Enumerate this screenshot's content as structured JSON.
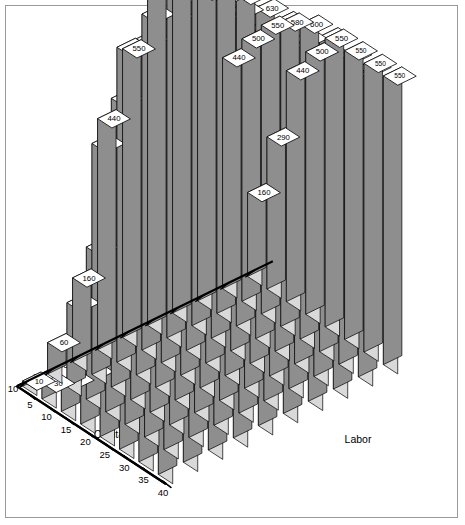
{
  "chart_data": {
    "type": "bar",
    "projection": "3d-isometric",
    "title": "",
    "xlabel": "Labor",
    "ylabel": "Capital",
    "zlabel": "",
    "grid": false,
    "legend": null,
    "x_categories": [
      10,
      20,
      30,
      40,
      50,
      60,
      70,
      80,
      90,
      100
    ],
    "y_categories": [
      40,
      35,
      30,
      25,
      20,
      15,
      10,
      5
    ],
    "x_tick_labels": [
      "10",
      "20",
      "30",
      "40",
      "50",
      "60",
      "70",
      "80",
      "90",
      "100"
    ],
    "y_tick_labels": [
      "40",
      "35",
      "30",
      "25",
      "20",
      "15",
      "10",
      "5"
    ],
    "zlim": [
      0,
      700
    ],
    "series": [
      {
        "name": "Capital 40",
        "capital": 40,
        "values": [
          130,
          440,
          500,
          550,
          600,
          620,
          600,
          600,
          590,
          550
        ]
      },
      {
        "name": "Capital 35",
        "capital": 35,
        "values": [
          160,
          440,
          550,
          600,
          620,
          630,
          620,
          620,
          590,
          550
        ]
      },
      {
        "name": "Capital 30",
        "capital": 30,
        "values": [
          160,
          320,
          550,
          610,
          630,
          640,
          630,
          620,
          600,
          550
        ]
      },
      {
        "name": "Capital 25",
        "capital": 25,
        "values": [
          160,
          290,
          550,
          620,
          640,
          650,
          640,
          630,
          600,
          550
        ]
      },
      {
        "name": "Capital 20",
        "capital": 20,
        "values": [
          100,
          240,
          580,
          630,
          650,
          660,
          650,
          630,
          580,
          500
        ]
      },
      {
        "name": "Capital 15",
        "capital": 15,
        "values": [
          60,
          290,
          550,
          640,
          660,
          670,
          650,
          630,
          550,
          440
        ]
      },
      {
        "name": "Capital 10",
        "capital": 10,
        "values": [
          30,
          160,
          440,
          600,
          640,
          660,
          640,
          620,
          500,
          290
        ]
      },
      {
        "name": "Capital 5",
        "capital": 5,
        "values": [
          10,
          60,
          160,
          440,
          550,
          650,
          620,
          590,
          440,
          160
        ]
      }
    ],
    "visible_labels": [
      130,
      160,
      160,
      160,
      100,
      60,
      30,
      10,
      440,
      440,
      320,
      290,
      240,
      290,
      160,
      60,
      500,
      550,
      550,
      550,
      580,
      550,
      440,
      160,
      600,
      600,
      610,
      620,
      630,
      640,
      600,
      440,
      620,
      620,
      630,
      640,
      650,
      660,
      640,
      550,
      600,
      620,
      630,
      650,
      660,
      670,
      660,
      650,
      600,
      620,
      630,
      640,
      650,
      650,
      640,
      620,
      590,
      590,
      600,
      630,
      630,
      630,
      620,
      590,
      550,
      550,
      550,
      580,
      500,
      440,
      290,
      160,
      20,
      40,
      60,
      430,
      290,
      530,
      560
    ]
  },
  "axes": {
    "capital": {
      "title": "Capital",
      "ticks": [
        "40",
        "35",
        "30",
        "25",
        "20",
        "15",
        "10",
        "5"
      ]
    },
    "labor": {
      "title": "Labor",
      "ticks": [
        "10",
        "20",
        "30",
        "40",
        "50",
        "60",
        "70",
        "80",
        "90",
        "100"
      ]
    }
  },
  "colors": {
    "bar_top": "#ffffff",
    "bar_light": "#d9d9d9",
    "bar_dark": "#8e8e8e",
    "outline": "#000000",
    "axis": "#000000",
    "frame": "#9a9a9a",
    "background": "#ffffff"
  }
}
